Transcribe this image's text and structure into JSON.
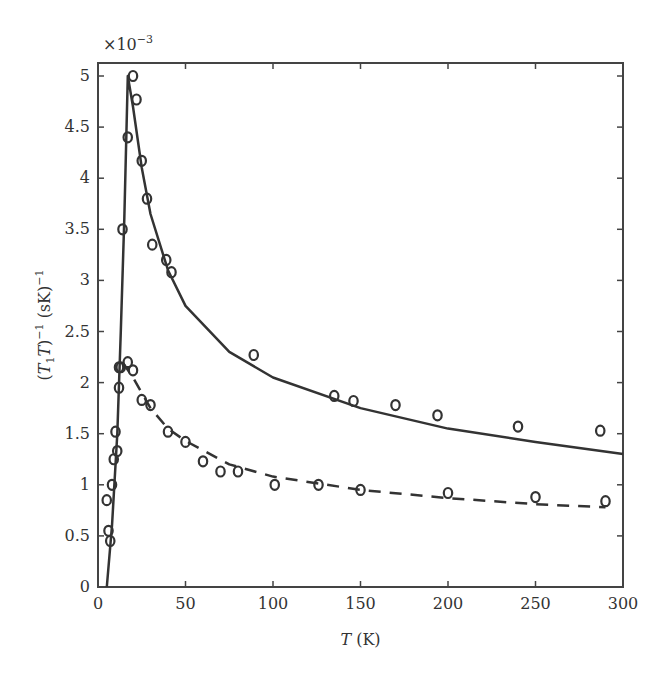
{
  "chart_data": {
    "type": "line",
    "title": "",
    "xlabel": "T (K)",
    "ylabel": "(T1 T)^-1 (sK)^-1",
    "y_multiplier": "×10^-3",
    "xlim": [
      0,
      300
    ],
    "ylim": [
      0,
      5.2
    ],
    "xticks": [
      0,
      50,
      100,
      150,
      200,
      250,
      300
    ],
    "yticks": [
      0,
      0.5,
      1,
      1.5,
      2,
      2.5,
      3,
      3.5,
      4,
      4.5,
      5
    ],
    "grid": false,
    "legend": null,
    "series": [
      {
        "name": "upper data (circles)",
        "style": "markers",
        "points": [
          [
            12,
            2.15
          ],
          [
            14,
            3.5
          ],
          [
            17,
            4.4
          ],
          [
            20,
            5.0
          ],
          [
            22,
            4.77
          ],
          [
            25,
            4.17
          ],
          [
            28,
            3.8
          ],
          [
            31,
            3.35
          ],
          [
            39,
            3.2
          ],
          [
            42,
            3.08
          ],
          [
            89,
            2.27
          ],
          [
            135,
            1.87
          ],
          [
            146,
            1.82
          ],
          [
            170,
            1.78
          ],
          [
            194,
            1.68
          ],
          [
            240,
            1.57
          ],
          [
            287,
            1.53
          ]
        ]
      },
      {
        "name": "upper fit (solid)",
        "style": "solid",
        "points": [
          [
            5,
            0
          ],
          [
            8,
            0.6
          ],
          [
            11,
            1.5
          ],
          [
            13,
            2.5
          ],
          [
            15,
            3.6
          ],
          [
            17,
            5.0
          ],
          [
            20,
            4.7
          ],
          [
            25,
            4.1
          ],
          [
            30,
            3.65
          ],
          [
            40,
            3.1
          ],
          [
            50,
            2.75
          ],
          [
            75,
            2.3
          ],
          [
            100,
            2.05
          ],
          [
            150,
            1.75
          ],
          [
            200,
            1.55
          ],
          [
            250,
            1.42
          ],
          [
            300,
            1.3
          ]
        ]
      },
      {
        "name": "lower data (circles)",
        "style": "markers",
        "points": [
          [
            5,
            0.85
          ],
          [
            6,
            0.55
          ],
          [
            7,
            0.45
          ],
          [
            8,
            1.0
          ],
          [
            9,
            1.25
          ],
          [
            10,
            1.52
          ],
          [
            11,
            1.33
          ],
          [
            12,
            1.95
          ],
          [
            13,
            2.15
          ],
          [
            17,
            2.2
          ],
          [
            20,
            2.12
          ],
          [
            25,
            1.83
          ],
          [
            30,
            1.78
          ],
          [
            40,
            1.52
          ],
          [
            50,
            1.42
          ],
          [
            60,
            1.23
          ],
          [
            70,
            1.13
          ],
          [
            80,
            1.13
          ],
          [
            101,
            1.0
          ],
          [
            126,
            1.0
          ],
          [
            150,
            0.95
          ],
          [
            200,
            0.92
          ],
          [
            250,
            0.88
          ],
          [
            290,
            0.84
          ]
        ]
      },
      {
        "name": "lower fit (dashed)",
        "style": "dashed",
        "points": [
          [
            14,
            2.2
          ],
          [
            20,
            2.05
          ],
          [
            30,
            1.75
          ],
          [
            40,
            1.55
          ],
          [
            50,
            1.43
          ],
          [
            75,
            1.2
          ],
          [
            100,
            1.08
          ],
          [
            150,
            0.95
          ],
          [
            200,
            0.87
          ],
          [
            250,
            0.81
          ],
          [
            290,
            0.78
          ]
        ]
      }
    ]
  }
}
